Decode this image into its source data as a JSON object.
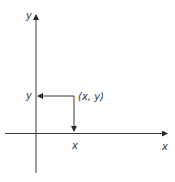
{
  "diagram": {
    "colors": {
      "line": "#3a3a3a",
      "text": "#333333",
      "background": "#ffffff"
    },
    "axes": {
      "y_axis_label": "y",
      "x_axis_label": "x"
    },
    "point": {
      "label": "(x, y)",
      "y_projection_label": "y",
      "x_projection_label": "x"
    }
  }
}
